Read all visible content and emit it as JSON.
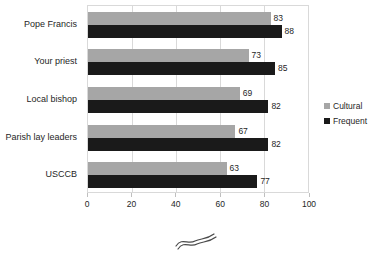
{
  "chart_data": {
    "type": "bar",
    "orientation": "horizontal",
    "title": "",
    "categories": [
      "Pope Francis",
      "Your priest",
      "Local bishop",
      "Parish lay leaders",
      "USCCB"
    ],
    "series": [
      {
        "name": "Cultural",
        "color": "#a6a6a6",
        "values": [
          83,
          73,
          69,
          67,
          63
        ]
      },
      {
        "name": "Frequent",
        "color": "#1a1a1a",
        "values": [
          88,
          85,
          82,
          82,
          77
        ]
      }
    ],
    "xlim": [
      0,
      100
    ],
    "xticks": [
      0,
      20,
      40,
      60,
      80,
      100
    ],
    "grid": true,
    "value_labels": true,
    "legend_position": "right",
    "annotation": "hand-drawn axis-break squiggle centered below x-axis"
  },
  "colors": {
    "background": "#ffffff",
    "gridline": "#d9d9d9",
    "tick": "#bfbfbf",
    "text": "#262626",
    "squiggle": "#4a4a4a"
  }
}
